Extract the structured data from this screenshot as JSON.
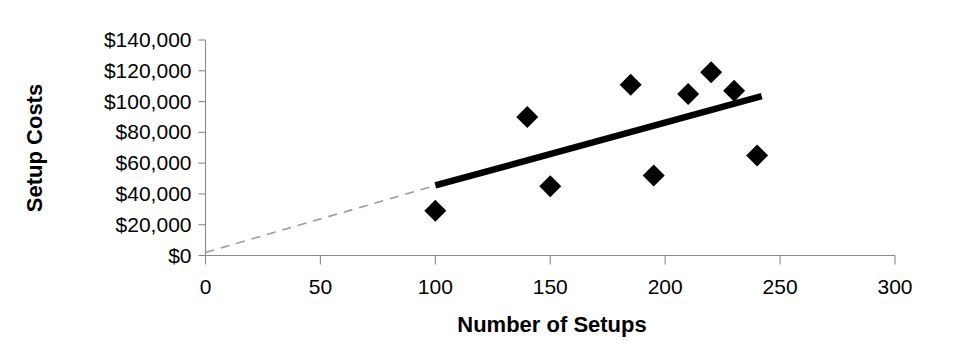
{
  "chart_data": {
    "type": "scatter",
    "title": "",
    "xlabel": "Number of Setups",
    "ylabel": "Setup Costs",
    "xlim": [
      0,
      300
    ],
    "ylim": [
      0,
      140000
    ],
    "xticks": [
      0,
      50,
      100,
      150,
      200,
      250,
      300
    ],
    "xticklabels": [
      "0",
      "50",
      "100",
      "150",
      "200",
      "250",
      "300"
    ],
    "yticks": [
      0,
      20000,
      40000,
      60000,
      80000,
      100000,
      120000,
      140000
    ],
    "yticklabels": [
      "$0",
      "$20,000",
      "$40,000",
      "$60,000",
      "$80,000",
      "$100,000",
      "$120,000",
      "$140,000"
    ],
    "grid": false,
    "legend": null,
    "marker_shape": "diamond",
    "marker_color": "#000000",
    "x": [
      100,
      140,
      150,
      185,
      195,
      210,
      220,
      230,
      240
    ],
    "y": [
      29000,
      90000,
      45000,
      111000,
      52000,
      105000,
      119000,
      107000,
      65000
    ],
    "points": [
      {
        "x": 100,
        "y": 29000
      },
      {
        "x": 140,
        "y": 90000
      },
      {
        "x": 150,
        "y": 45000
      },
      {
        "x": 185,
        "y": 111000
      },
      {
        "x": 195,
        "y": 52000
      },
      {
        "x": 210,
        "y": 105000
      },
      {
        "x": 220,
        "y": 119000
      },
      {
        "x": 230,
        "y": 107000
      },
      {
        "x": 240,
        "y": 65000
      }
    ],
    "trendline": {
      "style": "solid",
      "color": "#000000",
      "x_start": 100,
      "y_start": 45500,
      "x_end": 242,
      "y_end": 103500
    },
    "trendline_extension": {
      "style": "dashed",
      "color": "#9a9a9a",
      "x_start": 0,
      "y_start": 2000,
      "x_end": 100,
      "y_end": 45500
    }
  }
}
